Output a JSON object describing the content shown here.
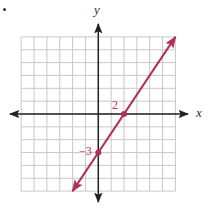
{
  "chart_data": {
    "type": "line",
    "title": "",
    "xlabel": "x",
    "ylabel": "y",
    "xlim": [
      -6,
      6
    ],
    "ylim": [
      -6,
      6
    ],
    "grid": true,
    "grid_step": 1,
    "series": [
      {
        "name": "y = (3/2)x - 3",
        "equation": "y = 1.5x - 3",
        "slope": 1.5,
        "intercept": -3,
        "x": [
          -2,
          0,
          2,
          6
        ],
        "y": [
          -6,
          -3,
          0,
          6
        ],
        "arrows_both_ends": true,
        "color": "#b0305a"
      }
    ],
    "points": [
      {
        "x": 2,
        "y": 0,
        "label": "2"
      },
      {
        "x": 0,
        "y": -3,
        "label": "−3"
      }
    ],
    "annotations": [
      "2",
      "−3"
    ]
  },
  "labels": {
    "x_axis": "x",
    "y_axis": "y",
    "x_intercept": "2",
    "y_intercept": "−3"
  },
  "colors": {
    "line": "#b0305a",
    "axis": "#222222",
    "grid": "#c8c8c8"
  }
}
